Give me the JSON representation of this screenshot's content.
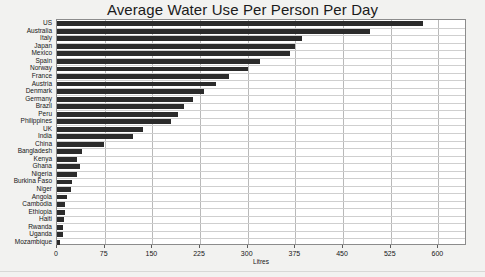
{
  "chart_data": {
    "type": "bar",
    "orientation": "horizontal",
    "title": "Average Water Use Per Person Per Day",
    "xlabel": "Litres",
    "ylabel": "",
    "xlim": [
      0,
      645
    ],
    "xticks": [
      0,
      75,
      150,
      225,
      300,
      375,
      450,
      525,
      600
    ],
    "xtick_labels": [
      "0",
      "75",
      "150",
      "225",
      "300",
      "375",
      "450",
      "525",
      "600"
    ],
    "grid": "vertical-and-horizontal",
    "legend": "none",
    "bar_color": "#2b2b2b",
    "categories": [
      "US",
      "Australia",
      "Italy",
      "Japan",
      "Mexico",
      "Spain",
      "Norway",
      "France",
      "Austria",
      "Denmark",
      "Germany",
      "Brazil",
      "Peru",
      "Philippines",
      "UK",
      "India",
      "China",
      "Bangladesh",
      "Kenya",
      "Ghana",
      "Nigeria",
      "Burkina Faso",
      "Niger",
      "Angola",
      "Cambodia",
      "Ethiopia",
      "Haiti",
      "Rwanda",
      "Uganda",
      "Mozambique"
    ],
    "values": [
      575,
      493,
      386,
      374,
      366,
      320,
      301,
      271,
      250,
      231,
      214,
      200,
      190,
      179,
      135,
      120,
      74,
      40,
      32,
      36,
      32,
      23,
      22,
      15,
      13,
      12,
      11,
      10,
      9,
      5
    ]
  },
  "axis": {
    "units_label": "Litres"
  }
}
